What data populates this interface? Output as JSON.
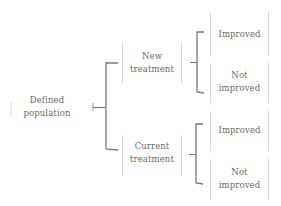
{
  "diagram": {
    "type": "tree",
    "colors": {
      "bracket": "#7a7a7a",
      "box_border": "#d8d8d8",
      "text": "#6a6a6a",
      "background": "#ffffff"
    },
    "root": {
      "line1": "Defined",
      "line2": "population"
    },
    "branches": [
      {
        "line1": "New",
        "line2": "treatment",
        "outcomes": [
          {
            "line1": "Improved",
            "line2": ""
          },
          {
            "line1": "Not",
            "line2": "improved"
          }
        ]
      },
      {
        "line1": "Current",
        "line2": "treatment",
        "outcomes": [
          {
            "line1": "Improved",
            "line2": ""
          },
          {
            "line1": "Not",
            "line2": "improved"
          }
        ]
      }
    ]
  }
}
